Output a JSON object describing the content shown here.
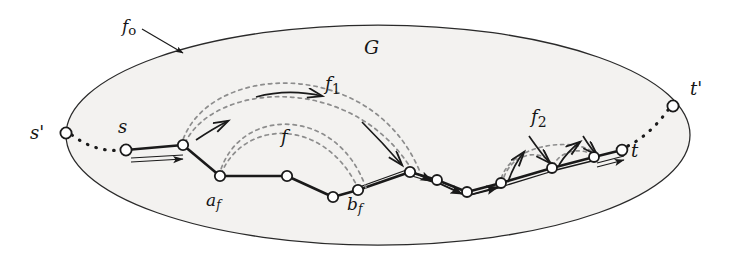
{
  "figure": {
    "background_color": "#ffffff",
    "ink_color": "#1a1a1a",
    "dashed_color": "#8a8a8a",
    "region_fill": "#f2f1ef"
  },
  "labels": {
    "graph": "G",
    "outer_face": "fo",
    "outer_face_base": "f",
    "outer_face_sub": "o",
    "source_outer": "s'",
    "source": "s",
    "sink": "t",
    "sink_outer": "t'",
    "face_f": "f",
    "face_f1_base": "f",
    "face_f1_sub": "1",
    "face_f2_base": "f",
    "face_f2_sub": "2",
    "a_f_base": "a",
    "a_f_sub": "f",
    "b_f_base": "b",
    "b_f_sub": "f"
  },
  "ellipse": {
    "cx": 378,
    "cy": 135,
    "rx": 312,
    "ry": 110
  },
  "nodes": [
    {
      "name": "s-prime",
      "x": 66,
      "y": 133,
      "label": "s'"
    },
    {
      "name": "s",
      "x": 126,
      "y": 150,
      "label": "s"
    },
    {
      "name": "v1",
      "x": 183,
      "y": 145,
      "label": ""
    },
    {
      "name": "a-f",
      "x": 220,
      "y": 176,
      "label": "a_f"
    },
    {
      "name": "v3",
      "x": 287,
      "y": 176,
      "label": ""
    },
    {
      "name": "v4",
      "x": 333,
      "y": 197,
      "label": ""
    },
    {
      "name": "b-f",
      "x": 358,
      "y": 190,
      "label": "b_f"
    },
    {
      "name": "v6",
      "x": 410,
      "y": 172,
      "label": ""
    },
    {
      "name": "v7",
      "x": 437,
      "y": 180,
      "label": ""
    },
    {
      "name": "v8",
      "x": 467,
      "y": 192,
      "label": ""
    },
    {
      "name": "v9",
      "x": 501,
      "y": 183,
      "label": ""
    },
    {
      "name": "v10",
      "x": 552,
      "y": 168,
      "label": ""
    },
    {
      "name": "v11",
      "x": 594,
      "y": 157,
      "label": ""
    },
    {
      "name": "t",
      "x": 622,
      "y": 150,
      "label": "t"
    },
    {
      "name": "t-prime",
      "x": 673,
      "y": 106,
      "label": "t'"
    }
  ],
  "label_positions": {
    "G": {
      "x": 364,
      "y": 38
    },
    "fo": {
      "x": 122,
      "y": 18
    },
    "s_prime": {
      "x": 30,
      "y": 124
    },
    "s": {
      "x": 118,
      "y": 118
    },
    "a_f": {
      "x": 206,
      "y": 192
    },
    "b_f": {
      "x": 347,
      "y": 196
    },
    "f": {
      "x": 281,
      "y": 128
    },
    "f1": {
      "x": 325,
      "y": 75
    },
    "f2": {
      "x": 531,
      "y": 108
    },
    "t": {
      "x": 631,
      "y": 142
    },
    "t_prime": {
      "x": 690,
      "y": 80
    }
  },
  "arcs": {
    "f_inner": "a_f to b_f (inner dashed arc)",
    "f_outer": "a_f to b_f (outer dashed arc)",
    "f1_inner": "v1 to v6 (inner dashed arc)",
    "f1_outer": "v1 to v6 (outer dashed arc)",
    "f2_inner": "v9 to v11 (nested dashed arcs)"
  }
}
